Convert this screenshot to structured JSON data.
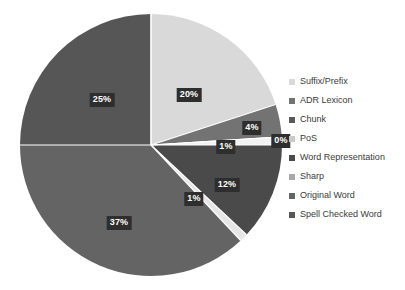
{
  "chart_data": {
    "type": "pie",
    "title": "",
    "subtitle": "",
    "xlabel": "",
    "ylabel": "",
    "grid": false,
    "legend_position": "right",
    "value_unit": "%",
    "start_angle_deg": 0,
    "direction": "clockwise",
    "total": 100,
    "categories": [
      "Suffix/Prefix",
      "ADR Lexicon",
      "Chunk",
      "PoS",
      "Word Representation",
      "Sharp",
      "Original Word",
      "Spell Checked Word"
    ],
    "values": [
      20,
      4,
      0,
      1,
      12,
      1,
      37,
      25
    ],
    "data_labels": [
      "20%",
      "4%",
      "0%",
      "1%",
      "12%",
      "1%",
      "37%",
      "25%"
    ],
    "colors": [
      "#d9d9d9",
      "#737373",
      "#bfbfbf",
      "#f2f2f2",
      "#4a4a4a",
      "#e6e6e6",
      "#646464",
      "#565656"
    ],
    "slices": [
      {
        "label": "Suffix/Prefix",
        "value": 20,
        "data_label": "20%",
        "color": "#d9d9d9",
        "label_x": 189,
        "label_y": 95
      },
      {
        "label": "ADR Lexicon",
        "value": 4,
        "data_label": "4%",
        "color": "#737373",
        "label_x": 252,
        "label_y": 128
      },
      {
        "label": "Chunk",
        "value": 0,
        "data_label": "0%",
        "color": "#bfbfbf",
        "label_x": 281,
        "label_y": 141
      },
      {
        "label": "PoS",
        "value": 1,
        "data_label": "1%",
        "color": "#f2f2f2",
        "label_x": 226,
        "label_y": 147
      },
      {
        "label": "Word Representation",
        "value": 12,
        "data_label": "12%",
        "color": "#4a4a4a",
        "label_x": 227,
        "label_y": 185
      },
      {
        "label": "Sharp",
        "value": 1,
        "data_label": "1%",
        "color": "#e6e6e6",
        "label_x": 194,
        "label_y": 199
      },
      {
        "label": "Original Word",
        "value": 37,
        "data_label": "37%",
        "color": "#646464",
        "label_x": 119,
        "label_y": 223
      },
      {
        "label": "Spell Checked Word",
        "value": 25,
        "data_label": "25%",
        "color": "#565656",
        "label_x": 102,
        "label_y": 100
      }
    ],
    "geometry": {
      "center_x": 151,
      "center_y": 145,
      "radius": 131,
      "separator_color": "#ffffff",
      "separator_width": 1.2
    }
  },
  "legend": {
    "items": [
      {
        "label": "Suffix/Prefix",
        "color": "#d9d9d9"
      },
      {
        "label": "ADR Lexicon",
        "color": "#737373"
      },
      {
        "label": "Chunk",
        "color": "#595959"
      },
      {
        "label": "PoS",
        "color": "#c9c9c9"
      },
      {
        "label": "Word Representation",
        "color": "#4a4a4a"
      },
      {
        "label": "Sharp",
        "color": "#a8a8a8"
      },
      {
        "label": "Original Word",
        "color": "#646464"
      },
      {
        "label": "Spell Checked Word",
        "color": "#565656"
      }
    ]
  }
}
